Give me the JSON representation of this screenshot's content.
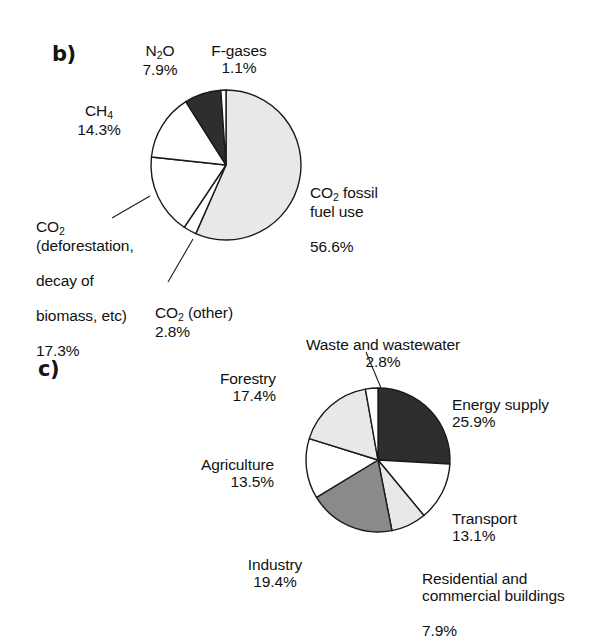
{
  "figure": {
    "background": "#ffffff",
    "panels": [
      {
        "letter": "b)"
      },
      {
        "letter": "c)"
      }
    ]
  },
  "palette": {
    "dark": "#2e2e2e",
    "medium_gray": "#8a8a8a",
    "light_gray": "#e8e8e8",
    "white": "#ffffff",
    "outline": "#1a1a1a",
    "text": "#121212"
  },
  "chart_data": [
    {
      "type": "pie",
      "panel": "b)",
      "title": "",
      "start_angle_deg": 0,
      "direction": "clockwise",
      "center": [
        226,
        165
      ],
      "radius": 75,
      "labels": [
        "CO2 fossil fuel use",
        "CO2 (other)",
        "CO2 (deforestation, decay of biomass, etc)",
        "CH4",
        "N2O",
        "F-gases"
      ],
      "values": [
        56.6,
        2.8,
        17.3,
        14.3,
        7.9,
        1.1
      ],
      "value_texts": [
        "56.6%",
        "2.8%",
        "17.3%",
        "14.3%",
        "7.9%",
        "1.1%"
      ],
      "colors": [
        "#e8e8e8",
        "#ffffff",
        "#ffffff",
        "#ffffff",
        "#2e2e2e",
        "#ffffff"
      ],
      "slices": [
        {
          "name": "co2-fossil-fuel-use",
          "label_line1": "CO",
          "label_sub1": "2",
          "label_line1b": " fossil",
          "label_line2": "fuel use",
          "pct": "56.6%",
          "value": 56.6,
          "color": "#e8e8e8"
        },
        {
          "name": "co2-other",
          "label_line1": "CO",
          "label_sub1": "2",
          "label_line1b": " (other)",
          "label_line2": "",
          "pct": "2.8%",
          "value": 2.8,
          "color": "#ffffff"
        },
        {
          "name": "co2-deforestation",
          "label_line1": "CO",
          "label_sub1": "2",
          "label_line1b": "",
          "label_line2": "(deforestation,",
          "label_line3": "decay of",
          "label_line4": "biomass, etc)",
          "pct": "17.3%",
          "value": 17.3,
          "color": "#ffffff"
        },
        {
          "name": "ch4",
          "label_line1": "CH",
          "label_sub1": "4",
          "label_line1b": "",
          "label_line2": "",
          "pct": "14.3%",
          "value": 14.3,
          "color": "#ffffff"
        },
        {
          "name": "n2o",
          "label_line1": "N",
          "label_sub1": "2",
          "label_line1b": "O",
          "label_line2": "",
          "pct": "7.9%",
          "value": 7.9,
          "color": "#2e2e2e"
        },
        {
          "name": "f-gases",
          "label_line1": "F-gases",
          "label_sub1": "",
          "label_line1b": "",
          "label_line2": "",
          "pct": "1.1%",
          "value": 1.1,
          "color": "#ffffff"
        }
      ]
    },
    {
      "type": "pie",
      "panel": "c)",
      "title": "",
      "start_angle_deg": 0,
      "direction": "clockwise",
      "center": [
        378,
        460
      ],
      "radius": 72,
      "labels": [
        "Energy supply",
        "Transport",
        "Residential and commercial buildings",
        "Industry",
        "Agriculture",
        "Forestry",
        "Waste and wastewater"
      ],
      "values": [
        25.9,
        13.1,
        7.9,
        19.4,
        13.5,
        17.4,
        2.8
      ],
      "value_texts": [
        "25.9%",
        "13.1%",
        "7.9%",
        "19.4%",
        "13.5%",
        "17.4%",
        "2.8%"
      ],
      "colors": [
        "#2e2e2e",
        "#ffffff",
        "#e8e8e8",
        "#8a8a8a",
        "#ffffff",
        "#e8e8e8",
        "#ffffff"
      ],
      "slices": [
        {
          "name": "energy-supply",
          "label": "Energy supply",
          "pct": "25.9%",
          "value": 25.9,
          "color": "#2e2e2e"
        },
        {
          "name": "transport",
          "label": "Transport",
          "pct": "13.1%",
          "value": 13.1,
          "color": "#ffffff"
        },
        {
          "name": "residential-commercial-buildings",
          "label_line1": "Residential and",
          "label_line2": "commercial buildings",
          "pct": "7.9%",
          "value": 7.9,
          "color": "#e8e8e8"
        },
        {
          "name": "industry",
          "label": "Industry",
          "pct": "19.4%",
          "value": 19.4,
          "color": "#8a8a8a"
        },
        {
          "name": "agriculture",
          "label": "Agriculture",
          "pct": "13.5%",
          "value": 13.5,
          "color": "#ffffff"
        },
        {
          "name": "forestry",
          "label": "Forestry",
          "pct": "17.4%",
          "value": 17.4,
          "color": "#e8e8e8"
        },
        {
          "name": "waste-and-wastewater",
          "label": "Waste and wastewater",
          "pct": "2.8%",
          "value": 2.8,
          "color": "#ffffff"
        }
      ]
    }
  ]
}
